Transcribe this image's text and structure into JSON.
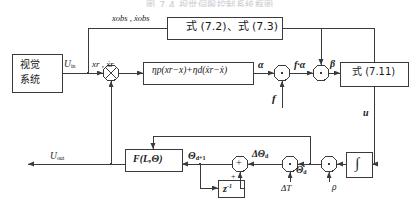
{
  "figure": {
    "title_top": "图 7.4  视觉伺服控制系统框图",
    "kind": "control-system-block-diagram"
  },
  "blocks": {
    "vision_system": {
      "line1": "视觉",
      "line2": "系统"
    },
    "observer": {
      "label": "式 (7.2)、式 (7.3)"
    },
    "pd_controller": {
      "label": "ηp(xr−x)+ηd(ẋr−ẋ)"
    },
    "eq711": {
      "label": "式 (7.11)"
    },
    "kinematics": {
      "label": "F(L,Θ)"
    },
    "delay": {
      "label": "z",
      "exp": "-1"
    },
    "integrator": {
      "label": "∫"
    }
  },
  "signals": {
    "u_in": "U",
    "u_in_sub": "in",
    "u_out": "U",
    "u_out_sub": "out",
    "x_ref": "xr , ẋr",
    "x_obs": "xobs , ẋobs",
    "alpha": "α",
    "f_alpha": "f·α",
    "beta": "β",
    "f": "f",
    "u": "u",
    "theta_d1": "Θ",
    "theta_d1_sub": "d+1",
    "delta_theta_d": "ΔΘ",
    "delta_theta_d_sub": "d",
    "theta_dot_d": "Θ̇",
    "theta_dot_d_sub": "d",
    "delta_T": "ΔT",
    "rho": "ρ",
    "plus_left": "+",
    "plus_bottom": "+"
  },
  "junctions": {
    "mult_input": "multiply",
    "mult_alpha": "multiply",
    "mult_beta": "multiply",
    "sum_theta": "sum",
    "mult_dT": "multiply",
    "mult_rho": "multiply"
  },
  "colors": {
    "stroke": "#3a3a3a",
    "block_fill": "#ffffff",
    "text": "#111111",
    "title": "#c9c9cf"
  }
}
